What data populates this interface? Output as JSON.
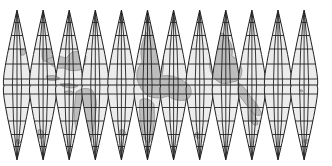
{
  "map": {
    "type": "interrupted globe gores",
    "gore_count": 12,
    "colors": {
      "background": "#ffffff",
      "ocean": "#ececec",
      "land": "#bdbdbd",
      "coast": "#7a7a7a",
      "graticule": "#222222"
    },
    "geometry": {
      "top_y": 10,
      "bottom_y": 160,
      "equator_y": 86,
      "first_center_x": 17,
      "gore_spacing": 26.1,
      "half_width": 13
    },
    "parallels_fraction": [
      0.083,
      0.17,
      0.26,
      0.36,
      0.46,
      0.5,
      0.56,
      0.65,
      0.74,
      0.83,
      0.91
    ],
    "meridians_per_gore": [
      -0.55,
      0,
      0.55
    ],
    "land_shapes": [
      {
        "name": "small-island-gore1",
        "d": "M20 50 q4 -2 6 2 q-1 4 -5 3 z"
      },
      {
        "name": "land-gore2-north",
        "d": "M42 50 q6 -4 10 2 q2 8 -4 10 q-6 0 -6 -6 z"
      },
      {
        "name": "land-gore2-3-asia",
        "d": "M46 60 q10 -6 20 -2 l6 -6 q10 -2 14 4 q0 10 -6 14 q-10 2 -16 -2 q-10 2 -18 -8 z"
      },
      {
        "name": "islands-archipelago",
        "d": "M46 76 q8 -2 14 2 q-4 4 -12 2 z M60 84 q10 -2 18 2 q-6 4 -16 0 z M64 92 q6 -3 10 1 q-2 3 -8 1 z"
      },
      {
        "name": "australia-like",
        "d": "M76 92 q8 -6 16 -2 q6 8 4 20 q-2 20 -6 36 q-6 6 -10 0 q-6 -20 -6 -36 z"
      },
      {
        "name": "southern-islands-left",
        "d": "M38 130 q4 -2 6 4 q-1 6 -5 4 z M16 140 q3 -2 5 2 q-2 3 -4 1 z"
      },
      {
        "name": "continent-center",
        "d": "M148 30 q4 -10 6 0 l6 10 q6 20 2 36 q10 -2 20 4 l8 6 q4 10 -4 14 q-10 2 -18 -4 q-10 4 -20 0 q-8 -6 -10 -14 q-4 -10 4 -20 q-4 -16 6 -32 z"
      },
      {
        "name": "continent-center-south",
        "d": "M140 100 q8 -4 14 4 q2 16 -2 34 q-4 10 -8 0 q-6 -20 -4 -38 z"
      },
      {
        "name": "continent-right",
        "d": "M214 40 q6 -12 12 -4 q8 8 6 20 q8 4 10 14 q0 12 -10 12 q-10 4 -16 -2 q-8 -8 -6 -20 q-2 -12 4 -20 z"
      },
      {
        "name": "peninsula-right",
        "d": "M238 82 q8 6 12 14 q8 8 12 18 q-4 4 -10 -2 q-8 -10 -14 -18 z"
      },
      {
        "name": "islands-right-south",
        "d": "M250 110 q6 4 8 14 q-4 4 -8 -4 z M258 130 q4 2 4 8 q-3 2 -5 -2 z"
      },
      {
        "name": "southern-islands-mid",
        "d": "M120 130 q4 -2 6 4 q-2 4 -6 0 z M196 132 q4 0 4 6 q-3 2 -5 -2 z M304 140 q6 -2 10 2 q-4 4 -10 0 z"
      },
      {
        "name": "small-island-right",
        "d": "M290 60 q2 -2 4 0 q-1 2 -3 1 z M300 90 q2 -1 3 1 q-1 2 -3 0 z"
      }
    ]
  }
}
